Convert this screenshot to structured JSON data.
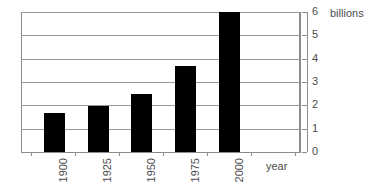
{
  "chart_data": {
    "type": "bar",
    "title": "",
    "subtitle": "",
    "categories": [
      "1900",
      "1925",
      "1950",
      "1975",
      "2000"
    ],
    "values": [
      1.65,
      1.95,
      2.5,
      3.7,
      6.0
    ],
    "series": [
      {
        "name": "World population",
        "values": [
          1.65,
          1.95,
          2.5,
          3.7,
          6.0
        ]
      }
    ],
    "xlabel": "year",
    "ylabel": "billions",
    "ylim": [
      0,
      6
    ],
    "xlim_note": "categorical",
    "yticks": [
      0,
      1,
      2,
      3,
      4,
      5,
      6
    ],
    "ytick_labels": [
      "0",
      "1",
      "2",
      "3",
      "4",
      "5",
      "6"
    ],
    "grid": true,
    "grid_axis": "y",
    "legend": false,
    "legend_position": "none",
    "bar_color": "#000000",
    "grid_color": "#999999",
    "axis_color": "#8c8c8c",
    "text_color": "#4d4d4d",
    "background_color": "#ffffff",
    "value_axis_position": "right",
    "annotations": []
  },
  "axes": {
    "y_unit_label": "billions",
    "x_axis_title": "year",
    "y_labels": [
      "6",
      "5",
      "4",
      "3",
      "2",
      "1",
      "0"
    ],
    "x_labels": [
      "1900",
      "1925",
      "1950",
      "1975",
      "2000"
    ]
  }
}
